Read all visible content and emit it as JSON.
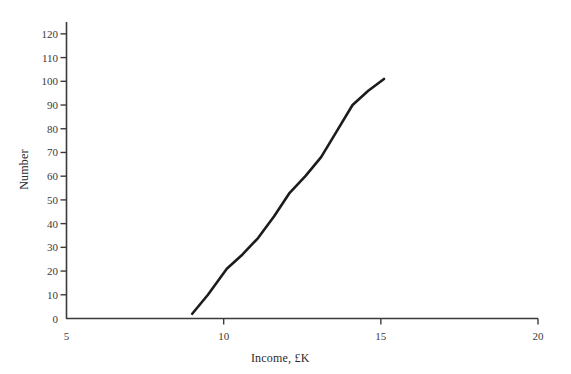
{
  "chart_data": {
    "type": "line",
    "title": "",
    "xlabel": "Income, £K",
    "ylabel": "Number",
    "xlim": [
      5,
      20
    ],
    "ylim": [
      0,
      125
    ],
    "xticks": [
      5,
      10,
      15,
      20
    ],
    "xtick_labels": [
      "5",
      "10",
      "15",
      "20"
    ],
    "yticks": [
      0,
      10,
      20,
      30,
      40,
      50,
      60,
      70,
      80,
      90,
      100,
      110,
      120
    ],
    "ytick_labels": [
      "0",
      "10",
      "20",
      "30",
      "40",
      "50",
      "60",
      "70",
      "80",
      "90",
      "100",
      "110",
      "120"
    ],
    "grid": false,
    "legend": null,
    "series": [
      {
        "name": "Number",
        "color": "#1c1c1c",
        "line_width": 2.6,
        "x": [
          9.0,
          9.5,
          10.1,
          10.6,
          11.1,
          11.6,
          12.1,
          12.6,
          13.1,
          13.6,
          14.1,
          14.6,
          15.1
        ],
        "y": [
          2,
          10,
          21,
          27,
          34,
          43,
          53,
          60,
          68,
          79,
          90,
          96,
          101
        ]
      }
    ]
  },
  "axes": {
    "x_title": "Income, £K",
    "y_title": "Number"
  }
}
